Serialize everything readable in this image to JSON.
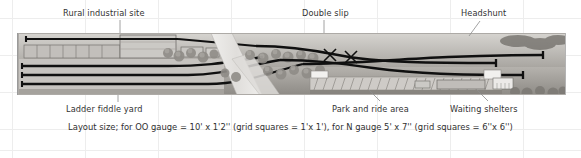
{
  "figure": {
    "kind": "model-railway-track-plan",
    "caption": "Layout size; for OO gauge = 10' x 1'2'' (grid squares = 1'x 1'), for N gauge 5' x 7'' (grid squares = 6''x 6'')"
  },
  "labels": {
    "top": [
      {
        "id": "rural-industrial-site",
        "text": "Rural industrial site",
        "x": 63,
        "y": 8,
        "leader": {
          "x1": 120,
          "y1": 20,
          "x2": 120,
          "y2": 33
        }
      },
      {
        "id": "double-slip",
        "text": "Double slip",
        "x": 302,
        "y": 8,
        "leader": {
          "x1": 324,
          "y1": 20,
          "x2": 324,
          "y2": 33
        }
      },
      {
        "id": "headshunt",
        "text": "Headshunt",
        "x": 461,
        "y": 8,
        "leader": {
          "x1": 480,
          "y1": 20,
          "x2": 470,
          "y2": 35
        }
      }
    ],
    "bottom": [
      {
        "id": "ladder-fiddle-yard",
        "text": "Ladder fiddle yard",
        "x": 66,
        "y": 104,
        "leader": {
          "x1": 118,
          "y1": 103,
          "x2": 118,
          "y2": 95
        }
      },
      {
        "id": "park-and-ride-area",
        "text": "Park and ride area",
        "x": 332,
        "y": 104,
        "leader": {
          "x1": 378,
          "y1": 102,
          "x2": 368,
          "y2": 92
        }
      },
      {
        "id": "waiting-shelters",
        "text": "Waiting shelters",
        "x": 450,
        "y": 104,
        "leader": {
          "x1": 486,
          "y1": 102,
          "x2": 476,
          "y2": 92
        }
      }
    ]
  },
  "colors": {
    "background": "#ffffff",
    "grid_line": "#ececec",
    "label_text": "#333333",
    "caption_text": "#2f2f2f",
    "track": "#101010",
    "ballast": "#b9b6b2",
    "ground_light": "#cfcdc9",
    "ground_dark": "#9b9892",
    "building_fill": "#c9c7c3",
    "building_stroke": "#6e6c68",
    "road": "#e2e0dd",
    "tree": "#8e8b85"
  },
  "plan": {
    "panel": {
      "x": 17,
      "y": 33,
      "width": 549,
      "height": 62
    },
    "features": [
      "ladder fiddle yard (left, three long through roads)",
      "rural industrial site sheds and siding with buffer stop",
      "double slip crossing at centre-right",
      "headshunt at right end with buffer stop",
      "park and ride area with angled parking bays",
      "waiting shelters on platform",
      "trees and embankment scenery",
      "road / river crossing diagonally through centre"
    ]
  },
  "grid": {
    "vertical_x": [
      12,
      85,
      158,
      231,
      304,
      377,
      450,
      523
    ],
    "horizontal_y": [
      18,
      55,
      92,
      129,
      150
    ],
    "line_color": "#ececec"
  }
}
